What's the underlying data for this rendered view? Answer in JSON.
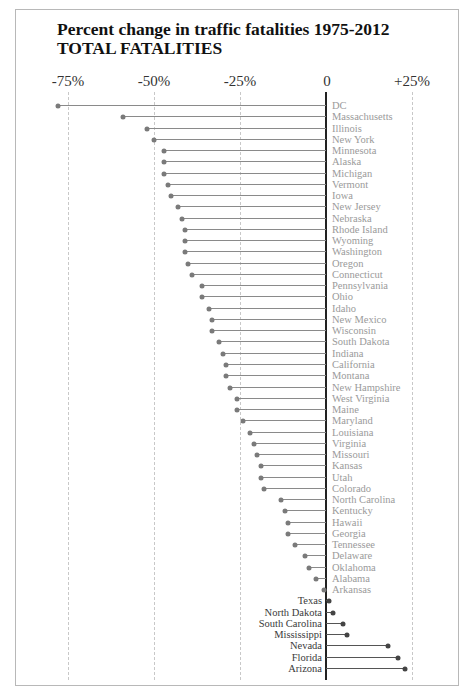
{
  "chart_data": {
    "type": "lollipop",
    "title": "Percent change in traffic fatalities 1975-2012",
    "subtitle": "TOTAL FATALITIES",
    "xlabel": "",
    "ylabel": "",
    "x_ticks": [
      "-75%",
      "-50%",
      "-25%",
      "0",
      "+25%"
    ],
    "x_tick_values": [
      -75,
      -50,
      -25,
      0,
      25
    ],
    "xlim": [
      -80,
      27
    ],
    "grid": "vertical dashed",
    "categories": [
      "DC",
      "Massachusetts",
      "Illinois",
      "New York",
      "Minnesota",
      "Alaska",
      "Michigan",
      "Vermont",
      "Iowa",
      "New Jersey",
      "Nebraska",
      "Rhode Island",
      "Wyoming",
      "Washington",
      "Oregon",
      "Connecticut",
      "Pennsylvania",
      "Ohio",
      "Idaho",
      "New Mexico",
      "Wisconsin",
      "South Dakota",
      "Indiana",
      "California",
      "Montana",
      "New Hampshire",
      "West Virginia",
      "Maine",
      "Maryland",
      "Louisiana",
      "Virginia",
      "Missouri",
      "Kansas",
      "Utah",
      "Colorado",
      "North Carolina",
      "Kentucky",
      "Hawaii",
      "Georgia",
      "Tennessee",
      "Delaware",
      "Oklahoma",
      "Alabama",
      "Arkansas",
      "Texas",
      "North Dakota",
      "South Carolina",
      "Mississippi",
      "Nevada",
      "Florida",
      "Arizona"
    ],
    "values": [
      -78,
      -59,
      -52,
      -50,
      -47,
      -47,
      -47,
      -46,
      -45,
      -43,
      -42,
      -41,
      -41,
      -41,
      -40,
      -39,
      -36,
      -36,
      -34,
      -33,
      -33,
      -31,
      -30,
      -29,
      -29,
      -28,
      -26,
      -26,
      -24,
      -22,
      -21,
      -20,
      -19,
      -19,
      -18,
      -13,
      -12,
      -11,
      -11,
      -9,
      -6,
      -5,
      -3,
      -0.5,
      1,
      2,
      5,
      6,
      18,
      21,
      23
    ]
  },
  "colors": {
    "negative_label": "#9a9a9a",
    "positive_label": "#3a3a3a",
    "zero_line": "#222222",
    "gridline": "#c8c8c8"
  }
}
